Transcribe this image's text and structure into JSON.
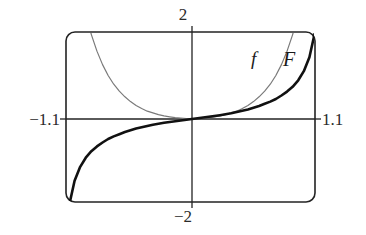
{
  "figure": {
    "title": "",
    "background_color": "#ffffff"
  },
  "axis_labels": {
    "top": "2",
    "bottom": "−2",
    "left": "−1.1",
    "right": "1.1"
  },
  "curve_labels": {
    "f": "f",
    "F": "F"
  },
  "chart_data": {
    "type": "line",
    "title": "",
    "xlabel": "",
    "ylabel": "",
    "xlim": [
      -1.1,
      1.1
    ],
    "ylim": [
      -2,
      2
    ],
    "grid": false,
    "legend": "inline-curve-labels",
    "x_tick_labels": [
      "−1.1",
      "1.1"
    ],
    "y_tick_labels": [
      "−2",
      "2"
    ],
    "axes": {
      "x_axis_at_y": 0,
      "y_axis_at_x": 0,
      "frame": "rounded-rectangle"
    },
    "series": [
      {
        "name": "f",
        "label": "f",
        "color": "#7a7a7a",
        "line_width": 1.2,
        "symmetry": "even",
        "x": [
          -1.1,
          -1.05,
          -1.0,
          -0.95,
          -0.9,
          -0.85,
          -0.8,
          -0.75,
          -0.7,
          -0.65,
          -0.6,
          -0.55,
          -0.5,
          -0.45,
          -0.4,
          -0.35,
          -0.3,
          -0.25,
          -0.2,
          -0.15,
          -0.1,
          -0.05,
          0.0,
          0.05,
          0.1,
          0.15,
          0.2,
          0.25,
          0.3,
          0.35,
          0.4,
          0.45,
          0.5,
          0.55,
          0.6,
          0.65,
          0.7,
          0.75,
          0.8,
          0.85,
          0.9,
          0.95,
          1.0,
          1.05,
          1.1
        ],
        "y": [
          4.65,
          3.73,
          3.0,
          2.41,
          1.94,
          1.56,
          1.25,
          1.0,
          0.8,
          0.64,
          0.51,
          0.4,
          0.31,
          0.24,
          0.18,
          0.14,
          0.1,
          0.07,
          0.05,
          0.03,
          0.02,
          0.01,
          0.0,
          0.01,
          0.02,
          0.03,
          0.05,
          0.07,
          0.1,
          0.14,
          0.18,
          0.24,
          0.31,
          0.4,
          0.51,
          0.64,
          0.8,
          1.0,
          1.25,
          1.56,
          1.94,
          2.41,
          3.0,
          3.73,
          4.65
        ]
      },
      {
        "name": "F",
        "label": "F",
        "color": "#111111",
        "line_width": 2.6,
        "symmetry": "odd",
        "x": [
          -1.1,
          -1.05,
          -1.0,
          -0.95,
          -0.9,
          -0.85,
          -0.8,
          -0.75,
          -0.7,
          -0.65,
          -0.6,
          -0.55,
          -0.5,
          -0.45,
          -0.4,
          -0.35,
          -0.3,
          -0.25,
          -0.2,
          -0.15,
          -0.1,
          -0.05,
          0.0,
          0.05,
          0.1,
          0.15,
          0.2,
          0.25,
          0.3,
          0.35,
          0.4,
          0.45,
          0.5,
          0.55,
          0.6,
          0.65,
          0.7,
          0.75,
          0.8,
          0.85,
          0.9,
          0.95,
          1.0,
          1.05,
          1.1
        ],
        "y": [
          -2.0,
          -1.42,
          -1.1,
          -0.89,
          -0.74,
          -0.63,
          -0.54,
          -0.46,
          -0.4,
          -0.35,
          -0.3,
          -0.26,
          -0.22,
          -0.19,
          -0.16,
          -0.13,
          -0.11,
          -0.088,
          -0.068,
          -0.05,
          -0.033,
          -0.016,
          0.0,
          0.016,
          0.033,
          0.05,
          0.068,
          0.088,
          0.11,
          0.13,
          0.16,
          0.19,
          0.22,
          0.26,
          0.3,
          0.35,
          0.4,
          0.46,
          0.54,
          0.63,
          0.74,
          0.89,
          1.1,
          1.42,
          2.0
        ]
      }
    ]
  },
  "geometry": {
    "frame_left": 66,
    "frame_right": 315,
    "frame_top": 32,
    "frame_bottom": 202,
    "corner_radius": 9,
    "origin_x": 192,
    "origin_y": 119
  }
}
